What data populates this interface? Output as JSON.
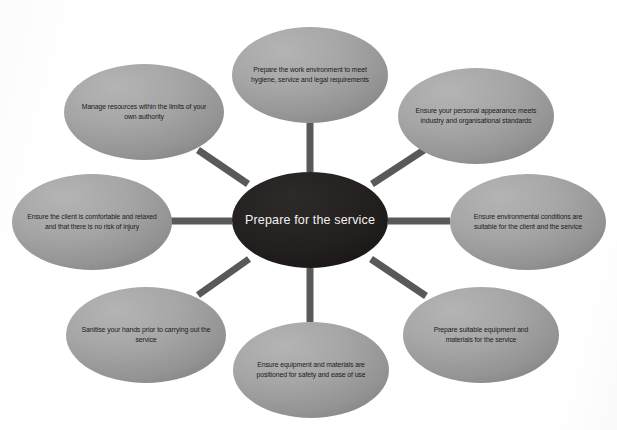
{
  "diagram": {
    "type": "hub-and-spoke",
    "title": "Prepare for the service",
    "center": {
      "label": "Prepare for the service",
      "fill": "#231f1f",
      "text_color": "#f2f2f2",
      "cx": 310,
      "cy": 220,
      "rx": 78,
      "ry": 48
    },
    "style": {
      "background": "#ffffff",
      "node_fill_light": "#a9a9a9",
      "node_fill_dark": "#8c8c8c",
      "node_text_color": "#1a1a1a",
      "spoke_color": "#595959",
      "spoke_width": 7
    },
    "nodes": [
      {
        "id": "node-top",
        "label": "Prepare the work environment to meet hygiene, service and legal requirements",
        "cx": 310,
        "cy": 75,
        "rx": 78,
        "ry": 48,
        "text_width": 140
      },
      {
        "id": "node-top-right",
        "label": "Ensure your personal appearance meets industry and organisational standards",
        "cx": 476,
        "cy": 116,
        "rx": 78,
        "ry": 48,
        "text_width": 140
      },
      {
        "id": "node-right",
        "label": "Ensure environmental conditions are suitable for the client and the service",
        "cx": 528,
        "cy": 222,
        "rx": 78,
        "ry": 48,
        "text_width": 140
      },
      {
        "id": "node-bottom-right",
        "label": "Prepare suitable equipment and materials for the service",
        "cx": 481,
        "cy": 335,
        "rx": 78,
        "ry": 48,
        "text_width": 132
      },
      {
        "id": "node-bottom",
        "label": "Ensure equipment and materials are positioned for safety and ease of use",
        "cx": 311,
        "cy": 370,
        "rx": 78,
        "ry": 48,
        "text_width": 142
      },
      {
        "id": "node-bottom-left",
        "label": "Sanitise your hands prior to carrying out the service",
        "cx": 146,
        "cy": 335,
        "rx": 80,
        "ry": 48,
        "text_width": 140
      },
      {
        "id": "node-left",
        "label": "Ensure the client is comfortable and relaxed and that there is no risk of injury",
        "cx": 92,
        "cy": 222,
        "rx": 80,
        "ry": 48,
        "text_width": 146
      },
      {
        "id": "node-top-left",
        "label": "Manage resources within the limits of your own authority",
        "cx": 144,
        "cy": 112,
        "rx": 80,
        "ry": 48,
        "text_width": 140
      }
    ],
    "spokes": [
      {
        "id": "spoke-top",
        "x1": 310,
        "y1": 172,
        "x2": 310,
        "y2": 123
      },
      {
        "id": "spoke-top-right",
        "x1": 372,
        "y1": 184,
        "x2": 424,
        "y2": 150
      },
      {
        "id": "spoke-right",
        "x1": 388,
        "y1": 221,
        "x2": 450,
        "y2": 221
      },
      {
        "id": "spoke-bottom-right",
        "x1": 371,
        "y1": 259,
        "x2": 426,
        "y2": 296
      },
      {
        "id": "spoke-bottom",
        "x1": 310,
        "y1": 268,
        "x2": 310,
        "y2": 322
      },
      {
        "id": "spoke-bottom-left",
        "x1": 249,
        "y1": 259,
        "x2": 198,
        "y2": 295
      },
      {
        "id": "spoke-left",
        "x1": 232,
        "y1": 221,
        "x2": 170,
        "y2": 221
      },
      {
        "id": "spoke-top-left",
        "x1": 248,
        "y1": 184,
        "x2": 198,
        "y2": 150
      }
    ]
  }
}
